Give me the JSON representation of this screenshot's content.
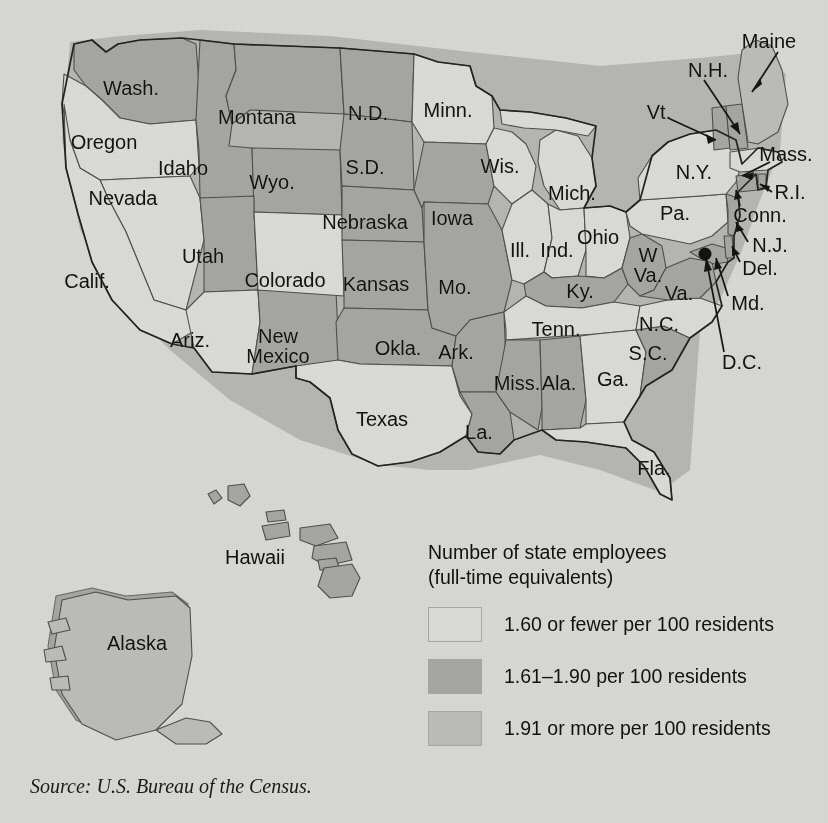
{
  "figure": {
    "type": "choropleth-map",
    "region": "United States",
    "source_note": "Source: U.S. Bureau of the Census."
  },
  "legend": {
    "title_line1": "Number of state employees",
    "title_line2": "(full-time equivalents)",
    "items": [
      {
        "label": "1.60 or fewer per 100 residents",
        "color": "#dcdcd8",
        "class_key": "low"
      },
      {
        "label": "1.61–1.90 per 100 residents",
        "color": "#a7a7a3",
        "class_key": "mid"
      },
      {
        "label": "1.91 or more per 100 residents",
        "color": "#bdbdb9",
        "class_key": "high"
      }
    ]
  },
  "colors": {
    "background": "#d9d9d5",
    "low": "#dcdcd8",
    "mid": "#a7a7a3",
    "high": "#bdbdb9",
    "outline": "#2a2a2a",
    "hairline": "#5d5d5a",
    "text": "#121212"
  },
  "chart_data": {
    "type": "heatmap",
    "value_unit": "full-time-equivalent state employees per 100 residents",
    "legend_position": "bottom-right",
    "bins": [
      {
        "key": "low",
        "label": "1.60 or fewer per 100 residents",
        "color": "#dcdcd8"
      },
      {
        "key": "mid",
        "label": "1.61–1.90 per 100 residents",
        "color": "#a7a7a3"
      },
      {
        "key": "high",
        "label": "1.91 or more per 100 residents",
        "color": "#bdbdb9"
      }
    ],
    "categories": [
      "Wash.",
      "Oregon",
      "Calif.",
      "Nevada",
      "Idaho",
      "Montana",
      "Wyo.",
      "Utah",
      "Ariz.",
      "Colorado",
      "New Mexico",
      "N.D.",
      "S.D.",
      "Nebraska",
      "Kansas",
      "Okla.",
      "Texas",
      "Minn.",
      "Iowa",
      "Mo.",
      "Ark.",
      "La.",
      "Wis.",
      "Ill.",
      "Mich.",
      "Ind.",
      "Ohio",
      "Ky.",
      "Tenn.",
      "Miss.",
      "Ala.",
      "Ga.",
      "Fla.",
      "S.C.",
      "N.C.",
      "Va.",
      "W. Va.",
      "Md.",
      "Del.",
      "Pa.",
      "N.J.",
      "N.Y.",
      "Conn.",
      "R.I.",
      "Mass.",
      "Vt.",
      "N.H.",
      "Maine",
      "Alaska",
      "Hawaii",
      "D.C."
    ],
    "values": [
      "mid",
      "low",
      "low",
      "low",
      "mid",
      "mid",
      "mid",
      "mid",
      "low",
      "low",
      "mid",
      "mid",
      "mid",
      "mid",
      "mid",
      "mid",
      "low",
      "low",
      "mid",
      "mid",
      "mid",
      "mid",
      "low",
      "low",
      "low",
      "low",
      "low",
      "mid",
      "low",
      "mid",
      "mid",
      "low",
      "low",
      "mid",
      "low",
      "mid",
      "mid",
      "mid",
      "mid",
      "low",
      "mid",
      "low",
      "mid",
      "mid",
      "low",
      "mid",
      "mid",
      "high",
      "high",
      "high",
      "mid"
    ]
  },
  "labels": {
    "states": [
      {
        "name": "Wash.",
        "x": 131,
        "y": 88,
        "size": 20
      },
      {
        "name": "Oregon",
        "x": 104,
        "y": 142,
        "size": 20
      },
      {
        "name": "Idaho",
        "x": 183,
        "y": 168,
        "size": 20
      },
      {
        "name": "Montana",
        "x": 257,
        "y": 117,
        "size": 20
      },
      {
        "name": "N.D.",
        "x": 368,
        "y": 113,
        "size": 20
      },
      {
        "name": "Minn.",
        "x": 448,
        "y": 110,
        "size": 20
      },
      {
        "name": "S.D.",
        "x": 365,
        "y": 167,
        "size": 20
      },
      {
        "name": "Wyo.",
        "x": 272,
        "y": 182,
        "size": 20
      },
      {
        "name": "Nevada",
        "x": 123,
        "y": 198,
        "size": 20
      },
      {
        "name": "Utah",
        "x": 203,
        "y": 256,
        "size": 20
      },
      {
        "name": "Nebraska",
        "x": 365,
        "y": 222,
        "size": 20
      },
      {
        "name": "Iowa",
        "x": 452,
        "y": 218,
        "size": 20
      },
      {
        "name": "Wis.",
        "x": 500,
        "y": 166,
        "size": 20
      },
      {
        "name": "Mich.",
        "x": 572,
        "y": 193,
        "size": 20
      },
      {
        "name": "Calif.",
        "x": 87,
        "y": 281,
        "size": 20
      },
      {
        "name": "Colorado",
        "x": 285,
        "y": 280,
        "size": 20
      },
      {
        "name": "Kansas",
        "x": 376,
        "y": 284,
        "size": 20
      },
      {
        "name": "Mo.",
        "x": 455,
        "y": 287,
        "size": 20
      },
      {
        "name": "Ill.",
        "x": 520,
        "y": 250,
        "size": 20
      },
      {
        "name": "Ind.",
        "x": 557,
        "y": 250,
        "size": 20
      },
      {
        "name": "Ohio",
        "x": 598,
        "y": 237,
        "size": 20
      },
      {
        "name": "Ky.",
        "x": 580,
        "y": 291,
        "size": 20
      },
      {
        "name": "Ariz.",
        "x": 190,
        "y": 340,
        "size": 20
      },
      {
        "name": "Okla.",
        "x": 398,
        "y": 348,
        "size": 20
      },
      {
        "name": "Ark.",
        "x": 456,
        "y": 352,
        "size": 20
      },
      {
        "name": "Tenn.",
        "x": 556,
        "y": 329,
        "size": 20
      },
      {
        "name": "N.C.",
        "x": 659,
        "y": 324,
        "size": 20
      },
      {
        "name": "S.C.",
        "x": 648,
        "y": 353,
        "size": 20
      },
      {
        "name": "Miss.",
        "x": 517,
        "y": 383,
        "size": 20
      },
      {
        "name": "Ala.",
        "x": 559,
        "y": 383,
        "size": 20
      },
      {
        "name": "Ga.",
        "x": 613,
        "y": 379,
        "size": 20
      },
      {
        "name": "Texas",
        "x": 382,
        "y": 419,
        "size": 20
      },
      {
        "name": "La.",
        "x": 479,
        "y": 432,
        "size": 20
      },
      {
        "name": "Fla.",
        "x": 654,
        "y": 468,
        "size": 20
      },
      {
        "name": "Pa.",
        "x": 675,
        "y": 213,
        "size": 20
      },
      {
        "name": "N.Y.",
        "x": 694,
        "y": 172,
        "size": 20
      },
      {
        "name": "Hawaii",
        "x": 255,
        "y": 557,
        "size": 20
      },
      {
        "name": "Alaska",
        "x": 137,
        "y": 643,
        "size": 20
      }
    ],
    "two_line_states": [
      {
        "line1": "New",
        "line2": "Mexico",
        "x": 278,
        "y": 346,
        "size": 20
      },
      {
        "line1": "W",
        "line2": "Va.",
        "x": 648,
        "y": 265,
        "size": 20
      },
      {
        "line1": "",
        "line2": "Va.",
        "x": 679,
        "y": 283,
        "size": 20
      }
    ],
    "callouts": [
      {
        "name": "Maine",
        "x": 769,
        "y": 41,
        "size": 20,
        "anchor": "middle"
      },
      {
        "name": "N.H.",
        "x": 708,
        "y": 70,
        "size": 20,
        "anchor": "middle"
      },
      {
        "name": "Vt.",
        "x": 659,
        "y": 112,
        "size": 20,
        "anchor": "middle"
      },
      {
        "name": "Mass.",
        "x": 786,
        "y": 154,
        "size": 20,
        "anchor": "middle"
      },
      {
        "name": "R.I.",
        "x": 790,
        "y": 192,
        "size": 20,
        "anchor": "middle"
      },
      {
        "name": "Conn.",
        "x": 760,
        "y": 215,
        "size": 20,
        "anchor": "middle"
      },
      {
        "name": "N.J.",
        "x": 770,
        "y": 245,
        "size": 20,
        "anchor": "middle"
      },
      {
        "name": "Del.",
        "x": 760,
        "y": 268,
        "size": 20,
        "anchor": "middle"
      },
      {
        "name": "Md.",
        "x": 748,
        "y": 303,
        "size": 20,
        "anchor": "middle"
      },
      {
        "name": "D.C.",
        "x": 742,
        "y": 362,
        "size": 20,
        "anchor": "middle"
      }
    ]
  }
}
